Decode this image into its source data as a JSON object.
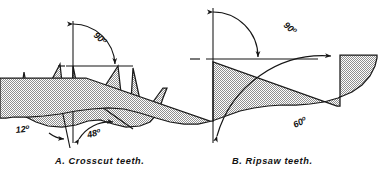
{
  "figure": {
    "background_color": "#ffffff",
    "ink_color": "#151515",
    "fill_pattern": "stipple-halftone-gray",
    "fill_color": "#9a9a9a"
  },
  "panels": [
    {
      "id": "A",
      "caption": "A.  Crosscut teeth.",
      "caption_label": "A.",
      "caption_name": "Crosscut teeth.",
      "tooth_type": "crosscut",
      "annotations": [
        {
          "name": "top-rake-angle",
          "value": "90",
          "unit": "o",
          "text": "90º"
        },
        {
          "name": "front-bevel-angle",
          "value": "12",
          "unit": "o",
          "text": "12º"
        },
        {
          "name": "back-bevel-angle",
          "value": "48",
          "unit": "o",
          "text": "48º"
        }
      ]
    },
    {
      "id": "B",
      "caption": "B.  Ripsaw  teeth.",
      "caption_label": "B.",
      "caption_name": "Ripsaw  teeth.",
      "tooth_type": "ripsaw",
      "annotations": [
        {
          "name": "top-rake-angle",
          "value": "90",
          "unit": "o",
          "text": "90º"
        },
        {
          "name": "tooth-included-angle",
          "value": "60",
          "unit": "o",
          "text": "60º"
        }
      ]
    }
  ],
  "labels": {
    "a90": "90",
    "a12": "12",
    "a48": "48",
    "b90": "90",
    "b60": "60",
    "degree": "o"
  }
}
